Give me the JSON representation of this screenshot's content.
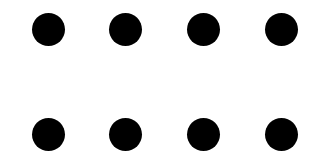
{
  "grid": {
    "rows": 2,
    "columns": 4,
    "dot_color": "#000000",
    "background_color": "#ffffff",
    "dot_diameter": 33,
    "dots": [
      {
        "row": 1,
        "col": 1,
        "cx": 48,
        "cy": 29
      },
      {
        "row": 1,
        "col": 2,
        "cx": 125,
        "cy": 29
      },
      {
        "row": 1,
        "col": 3,
        "cx": 203,
        "cy": 29
      },
      {
        "row": 1,
        "col": 4,
        "cx": 281,
        "cy": 29
      },
      {
        "row": 2,
        "col": 1,
        "cx": 48,
        "cy": 134
      },
      {
        "row": 2,
        "col": 2,
        "cx": 125,
        "cy": 134
      },
      {
        "row": 2,
        "col": 3,
        "cx": 203,
        "cy": 134
      },
      {
        "row": 2,
        "col": 4,
        "cx": 281,
        "cy": 134
      }
    ]
  }
}
